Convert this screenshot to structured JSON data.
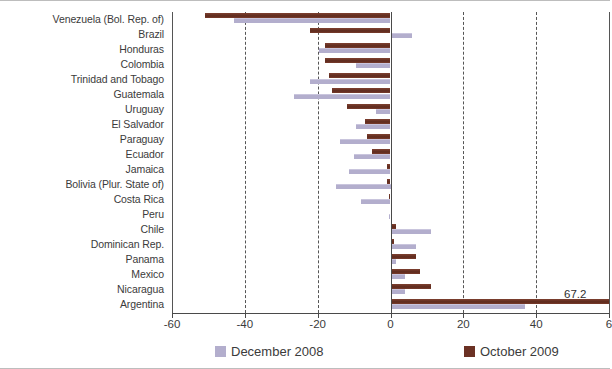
{
  "chart_data": {
    "type": "bar",
    "orientation": "horizontal",
    "title": "",
    "xlabel": "",
    "ylabel": "",
    "xlim": [
      -60,
      60
    ],
    "xticks": [
      -60,
      -40,
      -20,
      0,
      20,
      40,
      60
    ],
    "xticklabels": [
      "-60",
      "-40",
      "-20",
      "0",
      "20",
      "40",
      "6"
    ],
    "grid": true,
    "grid_style": "dashed-vertical",
    "legend_position": "bottom",
    "categories": [
      "Venezuela (Bol. Rep. of)",
      "Brazil",
      "Honduras",
      "Colombia",
      "Trinidad and Tobago",
      "Guatemala",
      "Uruguay",
      "El Salvador",
      "Paraguay",
      "Ecuador",
      "Jamaica",
      "Bolivia (Plur. State of)",
      "Costa Rica",
      "Peru",
      "Chile",
      "Dominican Rep.",
      "Panama",
      "Mexico",
      "Nicaragua",
      "Argentina"
    ],
    "series": [
      {
        "name": "December 2008",
        "color": "#b3aecd",
        "values": [
          -43.0,
          6.0,
          -19.5,
          -9.5,
          -22.0,
          -26.5,
          -4.0,
          -9.5,
          -14.0,
          -10.0,
          -11.5,
          -15.0,
          -8.0,
          -0.5,
          11.0,
          7.0,
          1.5,
          4.0,
          4.0,
          37.0
        ]
      },
      {
        "name": "October 2009",
        "color": "#6b3124",
        "values": [
          -51.0,
          -22.0,
          -18.0,
          -18.0,
          -17.0,
          -16.0,
          -12.0,
          -7.0,
          -6.5,
          -5.0,
          -1.0,
          -1.0,
          -0.5,
          0.5,
          1.5,
          1.0,
          7.0,
          8.0,
          11.0,
          67.2
        ]
      }
    ],
    "annotations": [
      {
        "text": "67.2",
        "category": "Argentina",
        "series": "October 2009"
      }
    ]
  },
  "legend": {
    "items": [
      {
        "label": "December 2008",
        "swatch": "dec-swatch"
      },
      {
        "label": "October 2009",
        "swatch": "oct-swatch"
      }
    ]
  }
}
